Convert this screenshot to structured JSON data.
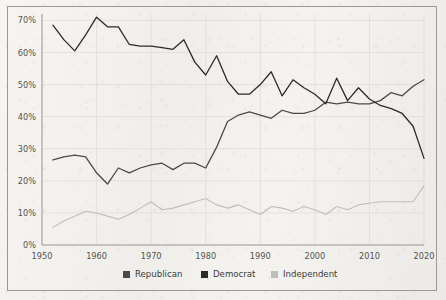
{
  "chart_data": {
    "type": "line",
    "title": "",
    "subtitle": "",
    "xlabel": "",
    "ylabel": "",
    "xlim": [
      1950,
      2020
    ],
    "ylim": [
      0,
      72
    ],
    "grid": true,
    "legend_position": "bottom",
    "x_ticks": [
      "1950",
      "1960",
      "1970",
      "1980",
      "1990",
      "2000",
      "2010",
      "2020"
    ],
    "x_tick_values": [
      1950,
      1960,
      1970,
      1980,
      1990,
      2000,
      2010,
      2020
    ],
    "y_ticks": [
      "0%",
      "10%",
      "20%",
      "30%",
      "40%",
      "50%",
      "60%",
      "70%"
    ],
    "y_tick_values": [
      0,
      10,
      20,
      30,
      40,
      50,
      60,
      70
    ],
    "x": [
      1952,
      1954,
      1956,
      1958,
      1960,
      1962,
      1964,
      1966,
      1968,
      1970,
      1972,
      1974,
      1976,
      1978,
      1980,
      1982,
      1984,
      1986,
      1988,
      1990,
      1992,
      1994,
      1996,
      1998,
      2000,
      2002,
      2004,
      2006,
      2008,
      2010,
      2012,
      2014,
      2016,
      2018,
      2020
    ],
    "series": [
      {
        "name": "Democrat",
        "color": "#2b2b2b",
        "values": [
          68.5,
          64.0,
          60.5,
          65.5,
          71.0,
          68.0,
          68.0,
          62.5,
          62.0,
          62.0,
          61.5,
          61.0,
          64.0,
          57.0,
          53.0,
          59.0,
          51.0,
          47.0,
          47.0,
          50.0,
          54.0,
          46.5,
          51.5,
          49.0,
          47.0,
          44.0,
          52.0,
          45.0,
          49.0,
          45.5,
          43.5,
          42.5,
          41.0,
          37.0,
          27.0
        ]
      },
      {
        "name": "Republican",
        "color": "#4a4a4a",
        "values": [
          26.5,
          27.5,
          28.0,
          27.5,
          22.5,
          19.0,
          24.0,
          22.5,
          24.0,
          25.0,
          25.5,
          23.5,
          25.5,
          25.5,
          24.0,
          30.5,
          38.5,
          40.5,
          41.5,
          40.5,
          39.5,
          42.0,
          41.0,
          41.0,
          42.0,
          44.5,
          44.0,
          44.5,
          44.0,
          44.0,
          45.0,
          47.5,
          46.5,
          49.5,
          51.5
        ]
      },
      {
        "name": "Independent",
        "color": "#bfbebb",
        "values": [
          5.5,
          7.5,
          9.0,
          10.5,
          10.0,
          9.0,
          8.0,
          9.5,
          11.5,
          13.5,
          11.0,
          11.5,
          12.5,
          13.5,
          14.5,
          12.5,
          11.5,
          12.5,
          11.0,
          9.5,
          12.0,
          11.5,
          10.5,
          12.0,
          11.0,
          9.5,
          12.0,
          11.0,
          12.5,
          13.0,
          13.5,
          13.5,
          13.5,
          13.5,
          18.5
        ]
      }
    ],
    "legend": [
      {
        "label": "Republican",
        "color": "#4a4a4a"
      },
      {
        "label": "Democrat",
        "color": "#2b2b2b"
      },
      {
        "label": "Independent",
        "color": "#bfbebb"
      }
    ]
  }
}
